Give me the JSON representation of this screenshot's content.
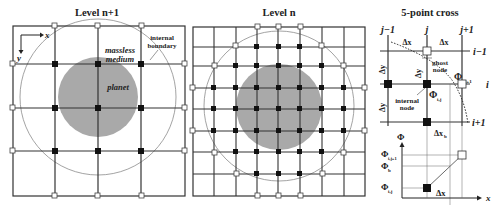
{
  "panels": {
    "left": {
      "title": "Level n+1",
      "axes": {
        "x": "x",
        "y": "y"
      },
      "labels": {
        "medium_line1": "massless",
        "medium_line2": "medium",
        "planet": "planet",
        "boundary_line1": "internal",
        "boundary_line2": "boundary"
      }
    },
    "middle": {
      "title": "Level n"
    },
    "right": {
      "title": "5-point cross",
      "columns": [
        "j−1",
        "j",
        "j+1"
      ],
      "rows": [
        "i−1",
        "i",
        "i+1"
      ],
      "dx1": "Δx",
      "dx2": "Δx",
      "dy1": "Δy",
      "dy2": "Δy",
      "dyb": "Δy",
      "dyb_sub": "b",
      "dxb": "Δx",
      "dxb_sub": "b",
      "ghost_line1": "ghost",
      "ghost_line2": "node",
      "internal_line1": "internal",
      "internal_line2": "node",
      "phi_ghost": "Φ",
      "phi_ghost_sub": "i,j+1",
      "phi_internal": "Φ",
      "phi_internal_sub": "i,j",
      "plot": {
        "y_axis": "Φ",
        "x_axis": "x",
        "tick_ghost": "Φ",
        "tick_ghost_sub": "i,j+1",
        "tick_b": "Φ",
        "tick_b_sub": "b",
        "tick_internal": "Φ",
        "tick_internal_sub": "i,j",
        "dx": "Δx"
      }
    }
  },
  "colors": {
    "grid": "#333333",
    "planet": "#a9a9a9",
    "boundary": "#8c8c8c",
    "internal_node": "#111111",
    "ghost_node": "#ffffff"
  }
}
